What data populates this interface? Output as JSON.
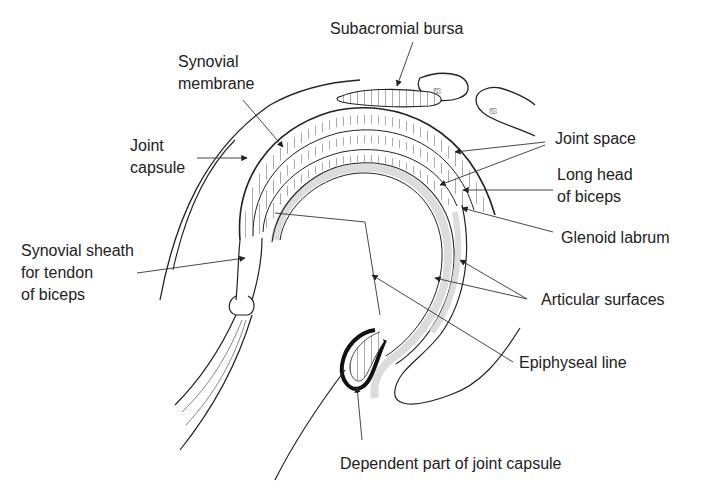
{
  "diagram": {
    "colors": {
      "ink": "#222222",
      "cartilage": "#dcdcdc",
      "background": "#ffffff"
    },
    "labels": [
      {
        "id": "subacromial-bursa",
        "lines": [
          "Subacromial bursa"
        ],
        "x": 330,
        "y": 18
      },
      {
        "id": "synovial-membrane",
        "lines": [
          "Synovial",
          "membrane"
        ],
        "x": 178,
        "y": 51
      },
      {
        "id": "joint-capsule",
        "lines": [
          "Joint",
          "capsule"
        ],
        "x": 130,
        "y": 135
      },
      {
        "id": "joint-space",
        "lines": [
          "Joint space"
        ],
        "x": 555,
        "y": 128
      },
      {
        "id": "long-head-of-biceps",
        "lines": [
          "Long head",
          "of biceps"
        ],
        "x": 557,
        "y": 164
      },
      {
        "id": "glenoid-labrum",
        "lines": [
          "Glenoid labrum"
        ],
        "x": 561,
        "y": 227
      },
      {
        "id": "synovial-sheath",
        "lines": [
          "Synovial sheath",
          "for tendon",
          "of biceps"
        ],
        "x": 21,
        "y": 240
      },
      {
        "id": "articular-surfaces",
        "lines": [
          "Articular surfaces"
        ],
        "x": 541,
        "y": 289
      },
      {
        "id": "epiphyseal-line",
        "lines": [
          "Epiphyseal line"
        ],
        "x": 519,
        "y": 352
      },
      {
        "id": "dependent-part",
        "lines": [
          "Dependent part of joint capsule"
        ],
        "x": 340,
        "y": 453
      }
    ]
  }
}
